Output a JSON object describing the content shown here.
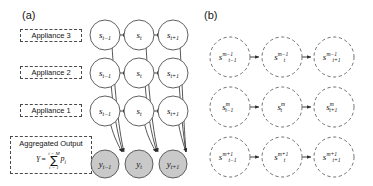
{
  "figure": {
    "panels": [
      {
        "id": "a",
        "label": "(a)",
        "side_labels": [
          {
            "text": "Appliance 3"
          },
          {
            "text": "Appliance 2"
          },
          {
            "text": "Appliance 1"
          }
        ],
        "aggregate_box": {
          "title": "Aggregated Output",
          "formula_lhs": "Y",
          "formula_eq": "=",
          "sigma_upper": "i = M",
          "sigma_symbol": "∑",
          "sigma_lower": "i = 1",
          "formula_term": "p",
          "formula_term_sub": "i"
        },
        "state_rows": [
          {
            "row_name": "appliance-3",
            "nodes": [
              {
                "base": "s",
                "sub": "t−1"
              },
              {
                "base": "s",
                "sub": "t"
              },
              {
                "base": "s",
                "sub": "t+1"
              }
            ]
          },
          {
            "row_name": "appliance-2",
            "nodes": [
              {
                "base": "s",
                "sub": "t−1"
              },
              {
                "base": "s",
                "sub": "t"
              },
              {
                "base": "s",
                "sub": "t+1"
              }
            ]
          },
          {
            "row_name": "appliance-1",
            "nodes": [
              {
                "base": "s",
                "sub": "t−1"
              },
              {
                "base": "s",
                "sub": "t"
              },
              {
                "base": "s",
                "sub": "t+1"
              }
            ]
          }
        ],
        "output_row": {
          "row_name": "aggregated-output",
          "nodes": [
            {
              "base": "y",
              "sub": "t−1"
            },
            {
              "base": "y",
              "sub": "t"
            },
            {
              "base": "y",
              "sub": "t+1"
            }
          ]
        }
      },
      {
        "id": "b",
        "label": "(b)",
        "rows": [
          {
            "row_name": "layer-m-minus-1",
            "nodes": [
              {
                "base": "s",
                "sub": "t−1",
                "sup": "m−1"
              },
              {
                "base": "s",
                "sub": "t",
                "sup": "m−1"
              },
              {
                "base": "s",
                "sub": "t+1",
                "sup": "m−1"
              }
            ]
          },
          {
            "row_name": "layer-m",
            "nodes": [
              {
                "base": "s",
                "sub": "t−1",
                "sup": "m"
              },
              {
                "base": "s",
                "sub": "t",
                "sup": "m"
              },
              {
                "base": "s",
                "sub": "t+1",
                "sup": "m"
              }
            ]
          },
          {
            "row_name": "layer-m-plus-1",
            "nodes": [
              {
                "base": "s",
                "sub": "t−1",
                "sup": "m+1"
              },
              {
                "base": "s",
                "sub": "t",
                "sup": "m+1"
              },
              {
                "base": "s",
                "sub": "t+1",
                "sup": "m+1"
              }
            ]
          }
        ]
      }
    ],
    "colors": {
      "node_stroke": "#555555",
      "node_fill_hidden": "#ffffff",
      "node_fill_observed": "#c9c9c9",
      "edge": "#333333",
      "box_border": "#4a4a4a",
      "text": "#131313",
      "background": "#ffffff"
    }
  }
}
